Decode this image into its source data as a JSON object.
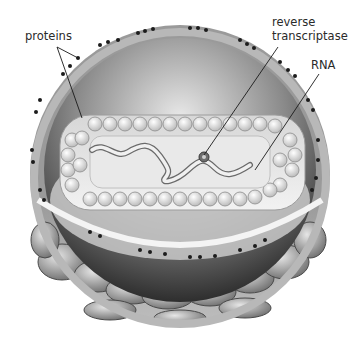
{
  "diagram": {
    "style": "grayscale illustration",
    "labels": [
      {
        "id": "proteins",
        "text": "proteins",
        "x": 25,
        "y": 30
      },
      {
        "id": "reverse_transcriptase_line1",
        "text": "reverse",
        "x": 272,
        "y": 17
      },
      {
        "id": "reverse_transcriptase_line2",
        "text": "transcriptase",
        "x": 272,
        "y": 31
      },
      {
        "id": "rna",
        "text": "RNA",
        "x": 311,
        "y": 60
      }
    ],
    "leaders": [
      {
        "from_label": "proteins",
        "x1": 57,
        "y1": 47,
        "x2": 78,
        "y2": 58
      },
      {
        "from_label": "proteins",
        "x1": 57,
        "y1": 47,
        "x2": 82,
        "y2": 118
      },
      {
        "from_label": "reverse transcriptase",
        "x1": 278,
        "y1": 47,
        "x2": 204,
        "y2": 155
      },
      {
        "from_label": "RNA",
        "x1": 319,
        "y1": 74,
        "x2": 255,
        "y2": 170
      }
    ]
  }
}
